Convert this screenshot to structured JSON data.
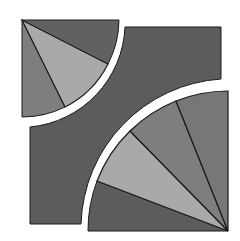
{
  "figure": {
    "colors": {
      "background": "#ffffff",
      "dark": "#5c5c5c",
      "medium": "#7e7e7e",
      "light": "#a9a9a9",
      "stroke": "#1a1a1a"
    },
    "small_quarter": {
      "center": [
        22,
        20
      ],
      "radius": 97,
      "segments": [
        "medium",
        "light",
        "dark"
      ]
    },
    "large_quarter": {
      "center": [
        228,
        231
      ],
      "radius": 140,
      "segments": [
        "dark",
        "light",
        "medium",
        "medium-dark"
      ]
    }
  }
}
